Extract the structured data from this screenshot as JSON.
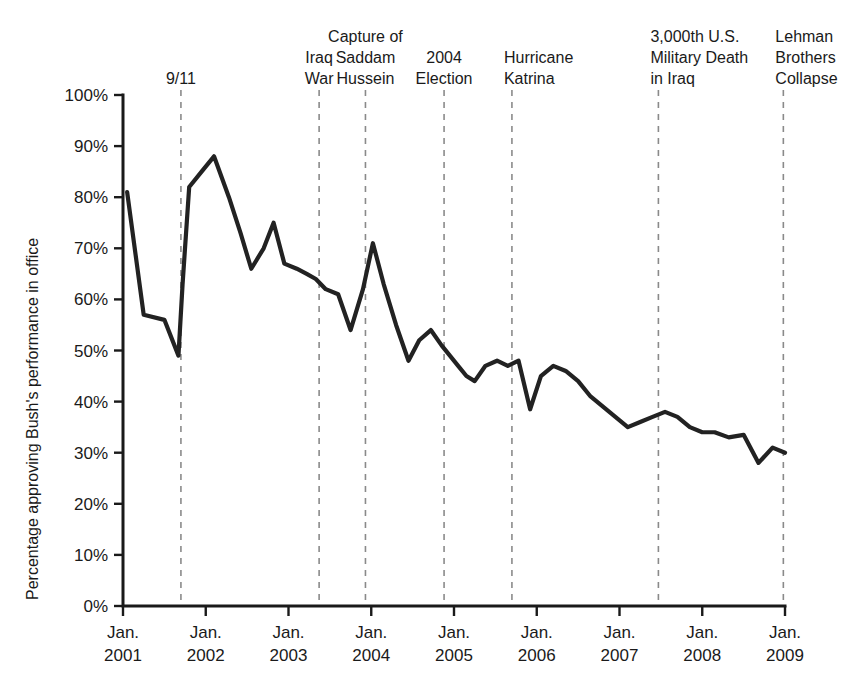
{
  "chart_data": {
    "type": "line",
    "title": "",
    "subtitle": "",
    "xlabel": "",
    "ylabel": "Percentage approving Bush's performance in office",
    "xlim": [
      2001.0,
      2009.0
    ],
    "ylim": [
      0,
      100
    ],
    "grid": false,
    "legend": "none",
    "y_ticks": [
      "0%",
      "10%",
      "20%",
      "30%",
      "40%",
      "50%",
      "60%",
      "70%",
      "80%",
      "90%",
      "100%"
    ],
    "y_tick_values": [
      0,
      10,
      20,
      30,
      40,
      50,
      60,
      70,
      80,
      90,
      100
    ],
    "x_ticks": [
      {
        "line1": "Jan.",
        "line2": "2001",
        "value": 2001.0
      },
      {
        "line1": "Jan.",
        "line2": "2002",
        "value": 2002.0
      },
      {
        "line1": "Jan.",
        "line2": "2003",
        "value": 2003.0
      },
      {
        "line1": "Jan.",
        "line2": "2004",
        "value": 2004.0
      },
      {
        "line1": "Jan.",
        "line2": "2005",
        "value": 2005.0
      },
      {
        "line1": "Jan.",
        "line2": "2006",
        "value": 2006.0
      },
      {
        "line1": "Jan.",
        "line2": "2007",
        "value": 2007.0
      },
      {
        "line1": "Jan.",
        "line2": "2008",
        "value": 2008.0
      },
      {
        "line1": "Jan.",
        "line2": "2009",
        "value": 2009.0
      }
    ],
    "series": [
      {
        "name": "Bush approval rating",
        "color": "#222222",
        "x": [
          2001.05,
          2001.25,
          2001.5,
          2001.67,
          2001.72,
          2001.8,
          2001.95,
          2002.1,
          2002.28,
          2002.42,
          2002.55,
          2002.7,
          2002.82,
          2002.95,
          2003.1,
          2003.22,
          2003.33,
          2003.45,
          2003.6,
          2003.75,
          2003.9,
          2004.02,
          2004.15,
          2004.3,
          2004.45,
          2004.58,
          2004.72,
          2004.85,
          2004.95,
          2005.05,
          2005.15,
          2005.25,
          2005.38,
          2005.52,
          2005.65,
          2005.78,
          2005.92,
          2006.05,
          2006.2,
          2006.35,
          2006.5,
          2006.65,
          2006.8,
          2006.95,
          2007.1,
          2007.25,
          2007.4,
          2007.55,
          2007.7,
          2007.85,
          2008.0,
          2008.15,
          2008.32,
          2008.5,
          2008.68,
          2008.85,
          2009.0
        ],
        "values": [
          81,
          57,
          56,
          49,
          63,
          82,
          85,
          88,
          80,
          73,
          66,
          70,
          75,
          67,
          66,
          65,
          64,
          62,
          61,
          54,
          62,
          71,
          63,
          55,
          48,
          52,
          54,
          51,
          49,
          47,
          45,
          44,
          47,
          48,
          47,
          48,
          38.5,
          45,
          47,
          46,
          44,
          41,
          39,
          37,
          35,
          36,
          37,
          38,
          37,
          35,
          34,
          34,
          33,
          33.5,
          28,
          31,
          30
        ]
      }
    ],
    "events": [
      {
        "label": "9/11",
        "lines": [
          "9/11"
        ],
        "x": 2001.7,
        "align": "middle"
      },
      {
        "label": "Iraq War",
        "lines": [
          "Iraq",
          "War"
        ],
        "x": 2003.37,
        "align": "middle"
      },
      {
        "label": "Capture of Saddam Hussein",
        "lines": [
          "Capture of",
          "Saddam",
          "Hussein"
        ],
        "x": 2003.93,
        "align": "middle"
      },
      {
        "label": "2004 Election",
        "lines": [
          "2004",
          "Election"
        ],
        "x": 2004.88,
        "align": "middle"
      },
      {
        "label": "Hurricane Katrina",
        "lines": [
          "Hurricane",
          "Katrina"
        ],
        "x": 2005.7,
        "align": "start"
      },
      {
        "label": "3,000th U.S. Military Death in Iraq",
        "lines": [
          "3,000th U.S.",
          "Military Death",
          "in Iraq"
        ],
        "x": 2007.47,
        "align": "start"
      },
      {
        "label": "Lehman Brothers Collapse",
        "lines": [
          "Lehman",
          "Brothers",
          "Collapse"
        ],
        "x": 2008.98,
        "align": "start"
      }
    ]
  }
}
